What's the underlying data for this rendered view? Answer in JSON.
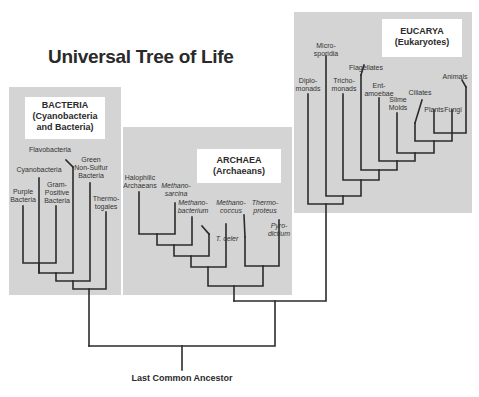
{
  "title": "Universal Tree of Life",
  "root_label": "Last Common Ancestor",
  "colors": {
    "panel": "#d4d4d4",
    "line": "#2b2b2b",
    "label_box": "#ffffff"
  },
  "domains": {
    "bacteria": {
      "name": "BACTERIA",
      "subtitle_line1": "(Cyanobacteria",
      "subtitle_line2": "and Bacteria)",
      "taxa": [
        {
          "line1": "Purple",
          "line2": "Bacteria"
        },
        {
          "line1": "Cyanobacteria",
          "line2": ""
        },
        {
          "line1": "Gram-",
          "line2": "Positive",
          "line3": "Bacteria"
        },
        {
          "line1": "Flavobacteria",
          "line2": ""
        },
        {
          "line1": "Green",
          "line2": "Non-Sulfur",
          "line3": "Bacteria"
        },
        {
          "line1": "Thermo-",
          "line2": "togales"
        }
      ]
    },
    "archaea": {
      "name": "ARCHAEA",
      "subtitle_line1": "(Archaeans)",
      "taxa": [
        {
          "line1": "Halophilic",
          "line2": "Archaeans"
        },
        {
          "line1": "Methano-",
          "line2": "sarcina"
        },
        {
          "line1": "Methano-",
          "line2": "bacterium"
        },
        {
          "line1": "Methano-",
          "line2": "coccus"
        },
        {
          "line1": "T. celer",
          "line2": ""
        },
        {
          "line1": "Thermo-",
          "line2": "proteus"
        },
        {
          "line1": "Pyro-",
          "line2": "dictium"
        }
      ]
    },
    "eucarya": {
      "name": "EUCARYA",
      "subtitle_line1": "(Eukaryotes)",
      "taxa": [
        {
          "line1": "Diplo-",
          "line2": "monads"
        },
        {
          "line1": "Micro-",
          "line2": "sporidia"
        },
        {
          "line1": "Tricho-",
          "line2": "monads"
        },
        {
          "line1": "Flagellates",
          "line2": ""
        },
        {
          "line1": "Ent-",
          "line2": "amoebae"
        },
        {
          "line1": "Slime",
          "line2": "Molds"
        },
        {
          "line1": "Ciliates",
          "line2": ""
        },
        {
          "line1": "Plants",
          "line2": ""
        },
        {
          "line1": "Fungi",
          "line2": ""
        },
        {
          "line1": "Animals",
          "line2": ""
        }
      ]
    }
  }
}
